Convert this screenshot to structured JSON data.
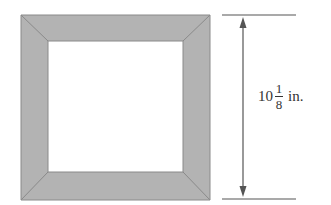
{
  "diagram": {
    "shape": "square picture frame",
    "dimension": {
      "whole": "10",
      "numerator": "1",
      "denominator": "8",
      "unit": "in."
    },
    "colors": {
      "frame": "#b3b3b3",
      "frame_edge": "#8a8a8a",
      "arrow": "#555555"
    }
  }
}
